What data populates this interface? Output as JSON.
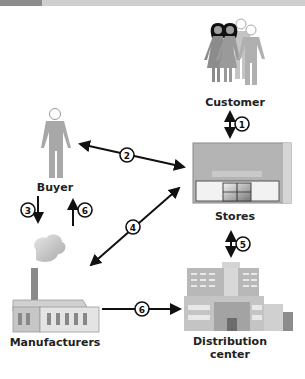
{
  "diagram": {
    "type": "supply-chain-flow",
    "nodes": [
      {
        "id": "customer",
        "label": "Customer",
        "icon": "people-group-icon"
      },
      {
        "id": "buyer",
        "label": "Buyer",
        "icon": "person-icon"
      },
      {
        "id": "stores",
        "label": "Stores",
        "icon": "storefront-icon"
      },
      {
        "id": "manufacturers",
        "label": "Manufacturers",
        "icon": "factory-icon"
      },
      {
        "id": "distribution",
        "label_line1": "Distribution",
        "label_line2": "center",
        "icon": "office-building-icon"
      }
    ],
    "edges": [
      {
        "step": "1",
        "from": "customer",
        "to": "stores",
        "direction": "both"
      },
      {
        "step": "2",
        "from": "stores",
        "to": "buyer",
        "direction": "both"
      },
      {
        "step": "3",
        "from": "buyer",
        "to": "manufacturers",
        "direction": "down"
      },
      {
        "step": "6",
        "from": "manufacturers",
        "to": "buyer",
        "direction": "up"
      },
      {
        "step": "4",
        "from": "stores",
        "to": "manufacturers",
        "direction": "both"
      },
      {
        "step": "5",
        "from": "stores",
        "to": "distribution",
        "direction": "both"
      },
      {
        "step": "6",
        "from": "manufacturers",
        "to": "distribution",
        "direction": "right"
      }
    ]
  },
  "labels": {
    "customer": "Customer",
    "buyer": "Buyer",
    "stores": "Stores",
    "manufacturers": "Manufacturers",
    "distribution_line1": "Distribution",
    "distribution_line2": "center"
  },
  "steps": {
    "s1": "1",
    "s2": "2",
    "s3": "3",
    "s4": "4",
    "s5": "5",
    "s6a": "6",
    "s6b": "6"
  },
  "colors": {
    "arrow": "#111111",
    "figure_gray": "#a8a8a8",
    "figure_dark": "#7a7a7a",
    "hair": "#111111",
    "store_wall": "#b9b9b9"
  }
}
